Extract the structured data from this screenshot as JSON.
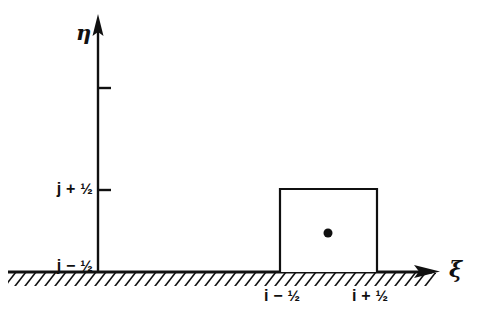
{
  "figure": {
    "background_color": "#ffffff",
    "ink_color": "#101010",
    "axes": {
      "vertical": {
        "name": "eta-axis",
        "label": "η",
        "x": 98,
        "y_top": 14,
        "y_bottom": 272,
        "arrow": "up"
      },
      "horizontal": {
        "name": "xi-axis",
        "label": "ξ",
        "y": 272,
        "x_left": 8,
        "x_right": 440,
        "arrow": "right",
        "hatched": true
      }
    },
    "y_ticks": [
      {
        "label": "",
        "y": 88,
        "labeled": false
      },
      {
        "label": "j + ½",
        "text_main": "j + ",
        "text_frac": "½",
        "y": 190,
        "labeled": true
      },
      {
        "label": "j − ½",
        "text_main": "j − ",
        "text_frac": "½",
        "y": 272,
        "labeled": true
      }
    ],
    "x_ticks": [
      {
        "label": "i − ½",
        "text_main": "i − ",
        "text_frac": "½",
        "x": 288,
        "labeled": true
      },
      {
        "label": "i + ½",
        "text_main": "i + ",
        "text_frac": "½",
        "x": 377,
        "labeled": true
      }
    ],
    "cell": {
      "name": "control-volume-cell",
      "x_left": 280,
      "x_right": 377,
      "y_top": 190,
      "y_bottom": 272,
      "fill": "#ffffff",
      "stroke": "#101010"
    },
    "cell_center_point": {
      "name": "cell-center-node",
      "cx": 328,
      "cy": 233,
      "r": 4.5,
      "fill": "#101010"
    }
  }
}
